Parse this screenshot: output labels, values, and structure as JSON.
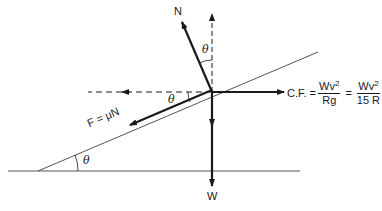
{
  "diagram": {
    "colors": {
      "ink": "#1a1a1a",
      "thin_line": "#555555",
      "background": "#ffffff"
    },
    "labels": {
      "normal": "N",
      "weight": "W",
      "friction": "F = μN",
      "theta_top": "θ",
      "theta_mid": "θ",
      "theta_base": "θ",
      "cf_prefix": "C.F. =",
      "cf_num1": "Wv",
      "cf_den1": "Rg",
      "equals": "=",
      "cf_num2": "Wv",
      "cf_den2": "15 R",
      "exponent": "2"
    },
    "forces": [
      {
        "name": "N",
        "direction": "normal to incline, up-left"
      },
      {
        "name": "W",
        "direction": "vertical down"
      },
      {
        "name": "F = μN",
        "direction": "down the incline"
      },
      {
        "name": "C.F.",
        "direction": "horizontal right"
      }
    ]
  }
}
